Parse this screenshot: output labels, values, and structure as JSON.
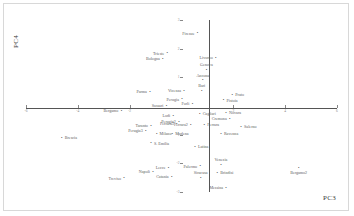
{
  "chart_data": {
    "type": "scatter",
    "title": "",
    "xlabel": "PC3",
    "ylabel": "PC4",
    "xlim": [
      -6,
      6
    ],
    "ylim": [
      -3,
      3
    ],
    "xticks": [
      -6,
      -4,
      -2,
      0,
      2,
      4,
      6
    ],
    "xtick_labels": [
      "-6",
      "-4",
      "-2",
      "0",
      "2",
      "4",
      "6"
    ],
    "yticks": [
      -3,
      -2,
      -1,
      0,
      1,
      2,
      3
    ],
    "ytick_labels": [
      "-3",
      "-2",
      "-1",
      "0",
      "1",
      "2",
      "3"
    ],
    "grid": false,
    "legend": null,
    "axes_style": "crossed-at-origin",
    "marker": "point",
    "points": [
      {
        "label": "Firenze",
        "x": 0.62,
        "y": 2.52,
        "anchor": "left"
      },
      {
        "label": "Trieste",
        "x": -0.55,
        "y": 1.82,
        "anchor": "left"
      },
      {
        "label": "Bologna",
        "x": -0.72,
        "y": 1.62,
        "anchor": "left"
      },
      {
        "label": "Livorno",
        "x": 1.32,
        "y": 1.66,
        "anchor": "left"
      },
      {
        "label": "Genova",
        "x": 0.96,
        "y": 1.24,
        "anchor": "top"
      },
      {
        "label": "Ancona",
        "x": 0.82,
        "y": 0.88,
        "anchor": "top"
      },
      {
        "label": "Bari",
        "x": 0.78,
        "y": 0.52,
        "anchor": "top"
      },
      {
        "label": "Parma",
        "x": -1.22,
        "y": 0.48,
        "anchor": "left"
      },
      {
        "label": "Vicenza",
        "x": 0.1,
        "y": 0.5,
        "anchor": "left"
      },
      {
        "label": "Prato",
        "x": 1.96,
        "y": 0.36,
        "anchor": "right"
      },
      {
        "label": "Perugia",
        "x": 0.02,
        "y": 0.22,
        "anchor": "left"
      },
      {
        "label": "Pistoia",
        "x": 1.62,
        "y": 0.18,
        "anchor": "right"
      },
      {
        "label": "Forli",
        "x": 0.42,
        "y": 0.06,
        "anchor": "left"
      },
      {
        "label": "Sassari",
        "x": -0.58,
        "y": -0.02,
        "anchor": "left"
      },
      {
        "label": "Cagliari",
        "x": 0.7,
        "y": -0.3,
        "anchor": "right"
      },
      {
        "label": "Novara",
        "x": 1.72,
        "y": -0.26,
        "anchor": "right"
      },
      {
        "label": "Lodi",
        "x": -0.32,
        "y": -0.36,
        "anchor": "left"
      },
      {
        "label": "Cremona",
        "x": 1.86,
        "y": -0.46,
        "anchor": "left"
      },
      {
        "label": "Bergamo",
        "x": -2.32,
        "y": -0.18,
        "anchor": "left"
      },
      {
        "label": "Perugia2",
        "x": -0.1,
        "y": -0.56,
        "anchor": "left"
      },
      {
        "label": "Ferrara",
        "x": 0.88,
        "y": -0.66,
        "anchor": "right"
      },
      {
        "label": "Ferrara2",
        "x": 0.36,
        "y": -0.66,
        "anchor": "left"
      },
      {
        "label": "Ferrara3",
        "x": -0.18,
        "y": -0.64,
        "anchor": "left"
      },
      {
        "label": "Taranto",
        "x": -1.18,
        "y": -0.7,
        "anchor": "left"
      },
      {
        "label": "Salerno",
        "x": 2.3,
        "y": -0.74,
        "anchor": "right"
      },
      {
        "label": "Perugia3",
        "x": -1.38,
        "y": -0.88,
        "anchor": "left"
      },
      {
        "label": "Milano",
        "x": -0.96,
        "y": -1.0,
        "anchor": "right"
      },
      {
        "label": "Modena",
        "x": -0.36,
        "y": -1.0,
        "anchor": "right"
      },
      {
        "label": "Ravenna",
        "x": 1.52,
        "y": -0.98,
        "anchor": "right"
      },
      {
        "label": "Brescia",
        "x": -4.62,
        "y": -1.12,
        "anchor": "right"
      },
      {
        "label": "S. Emilia",
        "x": -1.18,
        "y": -1.32,
        "anchor": "right"
      },
      {
        "label": "Latina",
        "x": 0.52,
        "y": -1.44,
        "anchor": "right"
      },
      {
        "label": "Venezia",
        "x": 1.52,
        "y": -2.06,
        "anchor": "top"
      },
      {
        "label": "Palermo",
        "x": 0.72,
        "y": -2.12,
        "anchor": "left"
      },
      {
        "label": "Lecce",
        "x": -0.5,
        "y": -2.18,
        "anchor": "left"
      },
      {
        "label": "Brindisi",
        "x": 1.38,
        "y": -2.36,
        "anchor": "right"
      },
      {
        "label": "Napoli",
        "x": -1.1,
        "y": -2.3,
        "anchor": "left"
      },
      {
        "label": "Catania",
        "x": -0.38,
        "y": -2.5,
        "anchor": "left"
      },
      {
        "label": "Siracusa",
        "x": 0.74,
        "y": -2.52,
        "anchor": "top"
      },
      {
        "label": "Treviso",
        "x": -2.22,
        "y": -2.54,
        "anchor": "left"
      },
      {
        "label": "Messina",
        "x": 1.72,
        "y": -2.86,
        "anchor": "left"
      },
      {
        "label": "Bergamo2",
        "x": 4.52,
        "y": -2.18,
        "anchor": "bottom"
      }
    ]
  }
}
